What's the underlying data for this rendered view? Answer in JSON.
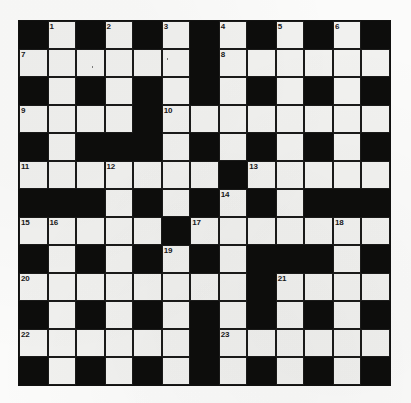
{
  "puzzle": {
    "title": "Crossword Grid",
    "columns": 13,
    "rows": 13,
    "colors": {
      "block": "#0d0d0c",
      "open": "#f1f1ef",
      "grid_line": "#1a1a19",
      "page_background": "#fbfbfa",
      "number_text": "#18181a"
    },
    "grid": [
      [
        "block",
        "open",
        "block",
        "open",
        "block",
        "open",
        "block",
        "open",
        "block",
        "open",
        "block",
        "open",
        "block"
      ],
      [
        "open",
        "open",
        "open",
        "open",
        "open",
        "open",
        "block",
        "open",
        "open",
        "open",
        "open",
        "open",
        "open"
      ],
      [
        "block",
        "open",
        "block",
        "open",
        "block",
        "open",
        "block",
        "open",
        "block",
        "open",
        "block",
        "open",
        "block"
      ],
      [
        "open",
        "open",
        "open",
        "open",
        "block",
        "open",
        "open",
        "open",
        "open",
        "open",
        "open",
        "open",
        "open"
      ],
      [
        "block",
        "open",
        "block",
        "block",
        "block",
        "open",
        "block",
        "open",
        "block",
        "open",
        "block",
        "open",
        "block"
      ],
      [
        "open",
        "open",
        "open",
        "open",
        "open",
        "open",
        "open",
        "block",
        "open",
        "open",
        "open",
        "open",
        "open"
      ],
      [
        "block",
        "block",
        "block",
        "open",
        "block",
        "open",
        "block",
        "open",
        "block",
        "open",
        "block",
        "block",
        "block"
      ],
      [
        "open",
        "open",
        "open",
        "open",
        "open",
        "block",
        "open",
        "open",
        "open",
        "open",
        "open",
        "open",
        "open"
      ],
      [
        "block",
        "open",
        "block",
        "open",
        "block",
        "open",
        "block",
        "open",
        "block",
        "block",
        "block",
        "open",
        "block"
      ],
      [
        "open",
        "open",
        "open",
        "open",
        "open",
        "open",
        "open",
        "open",
        "block",
        "open",
        "open",
        "open",
        "open"
      ],
      [
        "block",
        "open",
        "block",
        "open",
        "block",
        "open",
        "block",
        "open",
        "block",
        "open",
        "block",
        "open",
        "block"
      ],
      [
        "open",
        "open",
        "open",
        "open",
        "open",
        "open",
        "block",
        "open",
        "open",
        "open",
        "open",
        "open",
        "open"
      ],
      [
        "block",
        "open",
        "block",
        "open",
        "block",
        "open",
        "block",
        "open",
        "block",
        "open",
        "block",
        "open",
        "block"
      ]
    ],
    "numbers": [
      {
        "row": 0,
        "col": 1,
        "label": "1"
      },
      {
        "row": 0,
        "col": 3,
        "label": "2"
      },
      {
        "row": 0,
        "col": 5,
        "label": "3"
      },
      {
        "row": 0,
        "col": 7,
        "label": "4"
      },
      {
        "row": 0,
        "col": 9,
        "label": "5"
      },
      {
        "row": 0,
        "col": 11,
        "label": "6"
      },
      {
        "row": 1,
        "col": 0,
        "label": "7"
      },
      {
        "row": 1,
        "col": 7,
        "label": "8"
      },
      {
        "row": 3,
        "col": 0,
        "label": "9"
      },
      {
        "row": 3,
        "col": 5,
        "label": "10"
      },
      {
        "row": 5,
        "col": 0,
        "label": "11"
      },
      {
        "row": 5,
        "col": 3,
        "label": "12"
      },
      {
        "row": 5,
        "col": 8,
        "label": "13"
      },
      {
        "row": 6,
        "col": 7,
        "label": "14"
      },
      {
        "row": 7,
        "col": 0,
        "label": "15"
      },
      {
        "row": 7,
        "col": 1,
        "label": "16"
      },
      {
        "row": 7,
        "col": 6,
        "label": "17"
      },
      {
        "row": 7,
        "col": 11,
        "label": "18"
      },
      {
        "row": 8,
        "col": 5,
        "label": "19"
      },
      {
        "row": 9,
        "col": 0,
        "label": "20"
      },
      {
        "row": 9,
        "col": 9,
        "label": "21"
      },
      {
        "row": 11,
        "col": 0,
        "label": "22"
      },
      {
        "row": 11,
        "col": 7,
        "label": "23"
      }
    ],
    "specks": [
      {
        "row": 1,
        "col": 2,
        "x_pct": 55,
        "y_pct": 62
      },
      {
        "row": 1,
        "col": 5,
        "x_pct": 18,
        "y_pct": 30
      }
    ]
  }
}
